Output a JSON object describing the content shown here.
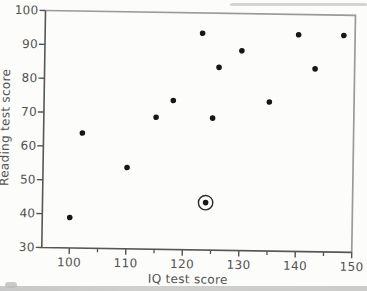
{
  "figure": {
    "background": "#fcfcfa",
    "ink_color": "#525252",
    "axis_dark_color": "#565656",
    "frame_light_color": "#9a9a9a",
    "dot_color": "#161616",
    "scan_band_color": "#c6c6c5"
  },
  "chart_data": {
    "type": "scatter",
    "xlabel": "IQ test score",
    "ylabel": "Reading test score",
    "xlim": [
      100,
      150
    ],
    "ylim": [
      30,
      100
    ],
    "x_ticks": [
      100,
      110,
      120,
      130,
      140,
      150
    ],
    "x_minor_ticks": [
      105,
      115,
      125,
      135,
      145
    ],
    "y_ticks": [
      30,
      40,
      50,
      60,
      70,
      80,
      90,
      100
    ],
    "grid": false,
    "legend": "none",
    "marker": "filled-dot",
    "annotation": "one outlier point circled",
    "points": [
      {
        "iq": 100,
        "reading": 39,
        "circled": false
      },
      {
        "iq": 102,
        "reading": 64,
        "circled": false
      },
      {
        "iq": 110,
        "reading": 54,
        "circled": false
      },
      {
        "iq": 115,
        "reading": 69,
        "circled": false
      },
      {
        "iq": 118,
        "reading": 74,
        "circled": false
      },
      {
        "iq": 123,
        "reading": 94,
        "circled": false
      },
      {
        "iq": 124,
        "reading": 44,
        "circled": true
      },
      {
        "iq": 125,
        "reading": 69,
        "circled": false
      },
      {
        "iq": 126,
        "reading": 84,
        "circled": false
      },
      {
        "iq": 130,
        "reading": 89,
        "circled": false
      },
      {
        "iq": 135,
        "reading": 74,
        "circled": false
      },
      {
        "iq": 140,
        "reading": 94,
        "circled": false
      },
      {
        "iq": 143,
        "reading": 84,
        "circled": false
      },
      {
        "iq": 148,
        "reading": 94,
        "circled": false
      }
    ]
  }
}
